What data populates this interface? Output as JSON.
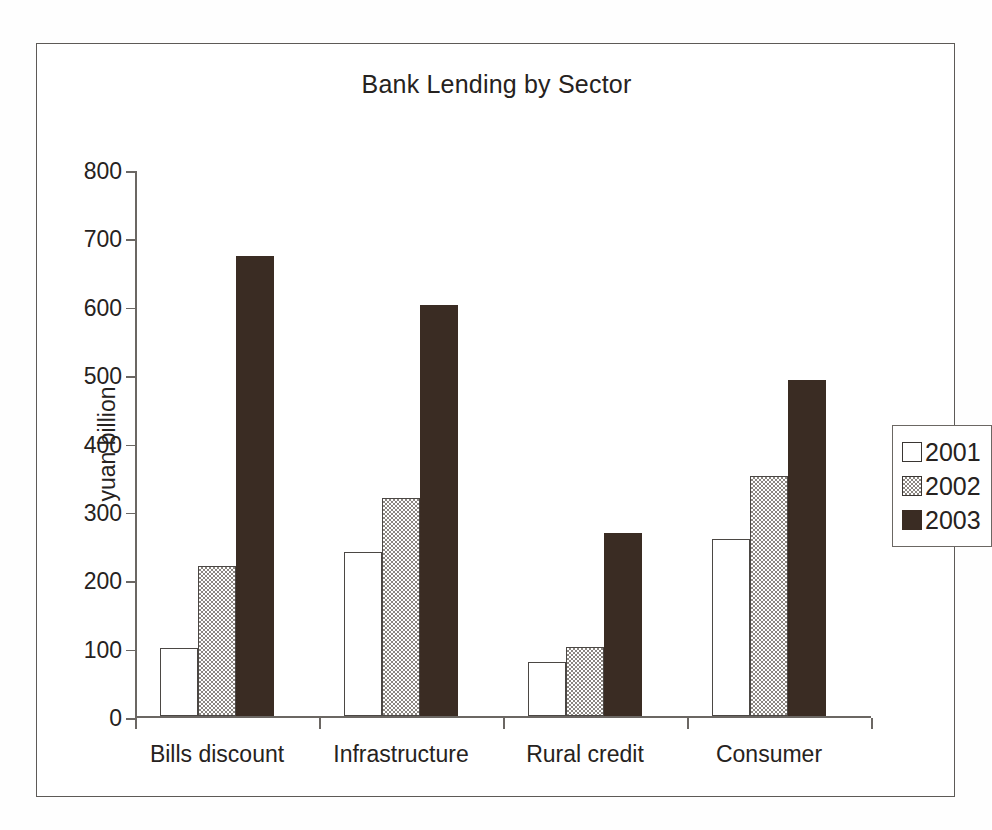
{
  "chart_data": {
    "type": "bar",
    "title": "Bank Lending by Sector",
    "xlabel": "",
    "ylabel": "yuan billion",
    "categories": [
      "Bills discount",
      "Infrastructure",
      "Rural credit",
      "Consumer"
    ],
    "series": [
      {
        "name": "2001",
        "values": [
          100,
          240,
          80,
          260
        ],
        "color": "#ffffff",
        "style": "open"
      },
      {
        "name": "2002",
        "values": [
          220,
          320,
          102,
          352
        ],
        "color": "#8b8681",
        "style": "checkered-gray"
      },
      {
        "name": "2003",
        "values": [
          673,
          602,
          268,
          492
        ],
        "color": "#3a2c23",
        "style": "solid-dark"
      }
    ],
    "ylim": [
      0,
      800
    ],
    "yticks": [
      0,
      100,
      200,
      300,
      400,
      500,
      600,
      700,
      800
    ],
    "ytick_labels": [
      "0",
      "100",
      "200",
      "300",
      "400",
      "500",
      "600",
      "700",
      "800"
    ],
    "grid": false,
    "legend_position": "right",
    "legend_entries": [
      "2001",
      "2002",
      "2003"
    ]
  },
  "figure": {
    "frame_color": "#5d5a57",
    "background": "#ffffff",
    "axis_color": "#6b6763",
    "text_color": "#262220"
  }
}
